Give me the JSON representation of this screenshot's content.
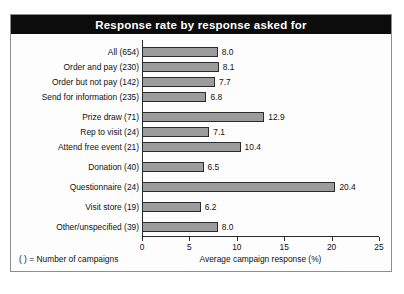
{
  "chart_data": {
    "type": "bar",
    "orientation": "horizontal",
    "title": "Response rate by response asked for",
    "xlabel": "Average campaign response (%)",
    "ylabel": "",
    "xlim": [
      0,
      25
    ],
    "xticks": [
      "0",
      "5",
      "10",
      "15",
      "20",
      "25"
    ],
    "grid": false,
    "legend": null,
    "note": "( ) = Number of campaigns",
    "categories": [
      "All (654)",
      "Order and pay (230)",
      "Order but not pay (142)",
      "Send for information (235)",
      "Prize draw (71)",
      "Rep to visit (24)",
      "Attend free event (21)",
      "Donation (40)",
      "Questionnaire (24)",
      "Visit store (19)",
      "Other/unspecified (39)"
    ],
    "values": [
      8.0,
      8.1,
      7.7,
      6.8,
      12.9,
      7.1,
      10.4,
      6.5,
      20.4,
      6.2,
      8.0
    ],
    "value_labels": [
      "8.0",
      "8.1",
      "7.7",
      "6.8",
      "12.9",
      "7.1",
      "10.4",
      "6.5",
      "20.4",
      "6.2",
      "8.0"
    ],
    "group_breaks_after": [
      3,
      6,
      7,
      8,
      9
    ],
    "colors": {
      "bar_fill": "#9c9c9c",
      "bar_border": "#2b2b2b",
      "title_bar": "#0c0c0c",
      "title_text": "#ffffff",
      "frame": "#8d8d8d",
      "background": "#fdfdfd",
      "text": "#111111"
    }
  }
}
